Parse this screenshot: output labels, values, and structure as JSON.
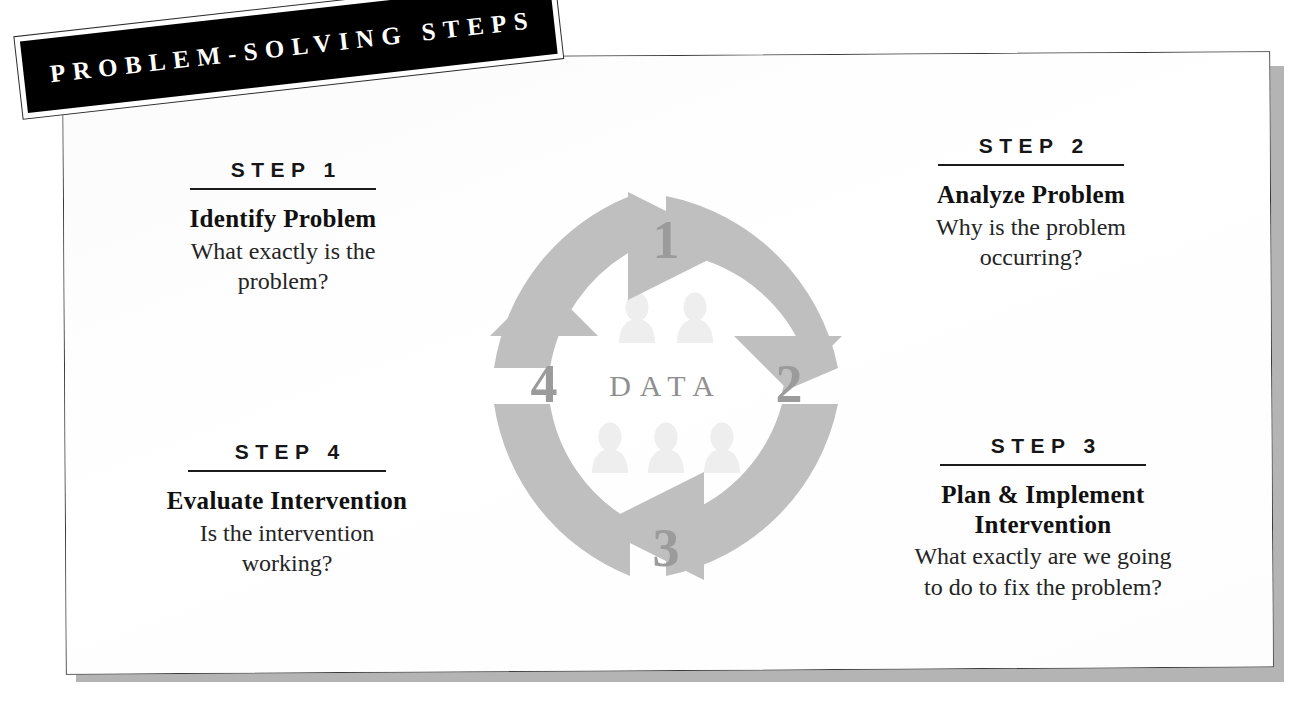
{
  "banner": {
    "title": "PROBLEM-SOLVING STEPS"
  },
  "steps": [
    {
      "kicker": "STEP 1",
      "title": "Identify Problem",
      "body_line1": "What exactly is the",
      "body_line2": "problem?"
    },
    {
      "kicker": "STEP 2",
      "title": "Analyze Problem",
      "body_line1": "Why is the problem",
      "body_line2": "occurring?"
    },
    {
      "kicker": "STEP 3",
      "title_line1": "Plan & Implement",
      "title_line2": "Intervention",
      "body_line1": "What exactly are we going",
      "body_line2": "to do to fix the problem?"
    },
    {
      "kicker": "STEP 4",
      "title": "Evaluate Intervention",
      "body_line1": "Is the intervention",
      "body_line2": "working?"
    }
  ],
  "cycle": {
    "center_label": "DATA",
    "numbers": {
      "top": "1",
      "right": "2",
      "bottom": "3",
      "left": "4"
    },
    "direction": "clockwise",
    "arrow_color": "#bfbfbf",
    "number_color": "#9b9b9b",
    "people_color": "#eeeeee",
    "people_top_count": 2,
    "people_bottom_count": 3
  },
  "colors": {
    "banner_background": "#000000",
    "banner_text": "#ffffff",
    "card_background": "#ffffff",
    "card_border": "#3a3a3a",
    "card_shadow": "#b4b4b4",
    "text": "#1a1a1a"
  }
}
